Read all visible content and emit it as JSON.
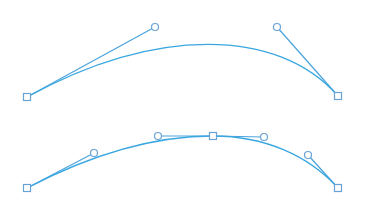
{
  "colors": {
    "background": "#ffffff",
    "curve": "#3aa7e0",
    "handle_line": "#4aa3dc",
    "marker_stroke": "#6aa2d4",
    "marker_fill": "#ffffff"
  },
  "diagrams": [
    {
      "name": "single-segment-bezier",
      "anchors": [
        {
          "x": 27,
          "y": 97
        },
        {
          "x": 338,
          "y": 96
        }
      ],
      "handles": [
        {
          "x": 155,
          "y": 27,
          "anchor": 0
        },
        {
          "x": 277,
          "y": 27,
          "anchor": 1
        }
      ],
      "path": "M27,97 C155,27 277,27 338,96"
    },
    {
      "name": "two-segment-bezier",
      "anchors": [
        {
          "x": 27,
          "y": 188
        },
        {
          "x": 213,
          "y": 136
        },
        {
          "x": 338,
          "y": 188
        }
      ],
      "handles": [
        {
          "x": 94,
          "y": 153,
          "anchor": 0
        },
        {
          "x": 158,
          "y": 136,
          "anchor": 1
        },
        {
          "x": 264,
          "y": 137,
          "anchor": 1
        },
        {
          "x": 308,
          "y": 155,
          "anchor": 2
        }
      ],
      "path": "M27,188 C94,153 158,136 213,136 C264,136 308,155 338,188"
    }
  ]
}
